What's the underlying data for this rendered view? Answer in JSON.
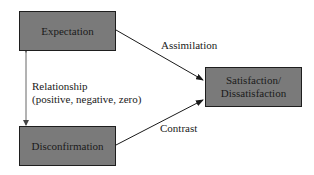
{
  "diagram": {
    "nodes": {
      "expectation": {
        "label": "Expectation"
      },
      "disconfirmation": {
        "label": "Disconfirmation"
      },
      "satisfaction": {
        "label_line1": "Satisfaction/",
        "label_line2": "Dissatisfaction"
      }
    },
    "edges": {
      "assimilation": {
        "label": "Assimilation",
        "from": "Expectation",
        "to": "Satisfaction/Dissatisfaction"
      },
      "contrast": {
        "label": "Contrast",
        "from": "Disconfirmation",
        "to": "Satisfaction/Dissatisfaction"
      },
      "relationship": {
        "label": "Relationship",
        "sublabel": "(positive, negative, zero)",
        "from": "Expectation",
        "to": "Disconfirmation",
        "bidirectional": true
      }
    },
    "colors": {
      "box_fill": "#7a7a7a",
      "box_border": "#1e1e1e",
      "line": "#1a1a1a",
      "relationship_line": "#555555",
      "text": "#1a1a1a"
    }
  }
}
